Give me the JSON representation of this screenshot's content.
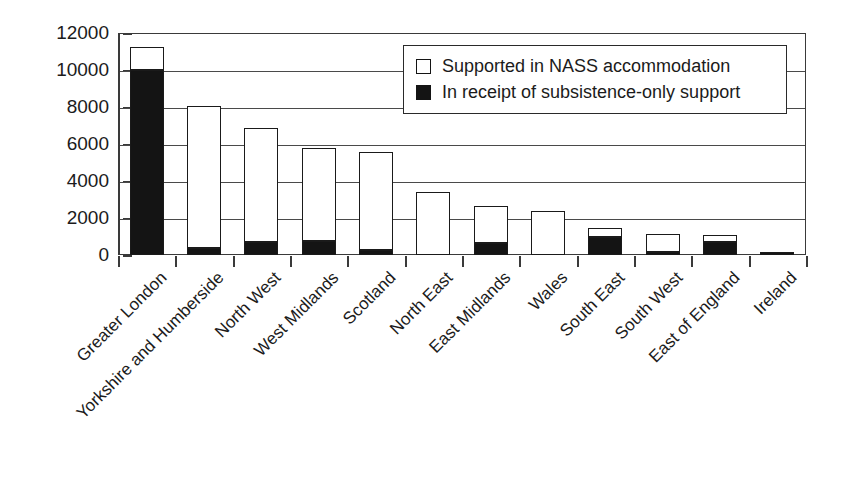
{
  "chart_data": {
    "type": "bar",
    "title": "",
    "subtitle": "",
    "xlabel": "",
    "ylabel": "",
    "stacked": true,
    "grid": true,
    "ylim": [
      0,
      12000
    ],
    "ytick_step": 2000,
    "yticks": [
      "12000",
      "10000",
      "8000",
      "6000",
      "4000",
      "2000",
      "0"
    ],
    "ytick_values": [
      12000,
      10000,
      8000,
      6000,
      4000,
      2000,
      0
    ],
    "legend_position": "top-right",
    "categories": [
      "Greater London",
      "Yorkshire and Humberside",
      "North West",
      "West Midlands",
      "Scotland",
      "North East",
      "East Midlands",
      "Wales",
      "South East",
      "South West",
      "East of England",
      "Ireland"
    ],
    "series": [
      {
        "name": "In receipt of subsistence-only support",
        "color": "#141414",
        "values": [
          10000,
          400,
          700,
          750,
          250,
          0,
          650,
          0,
          950,
          150,
          700,
          100
        ]
      },
      {
        "name": "Supported in NASS accommodation",
        "color": "#ffffff",
        "values": [
          1250,
          7650,
          6150,
          5050,
          5300,
          3400,
          2000,
          2400,
          500,
          1000,
          400,
          0
        ]
      }
    ],
    "totals": [
      11250,
      8050,
      6850,
      5800,
      5550,
      3400,
      2650,
      2400,
      1450,
      1150,
      1100,
      100
    ]
  },
  "legend": {
    "items": [
      {
        "label": "Supported in NASS accommodation",
        "swatch": "hollow"
      },
      {
        "label": "In receipt of subsistence-only support",
        "swatch": "filled"
      }
    ]
  }
}
